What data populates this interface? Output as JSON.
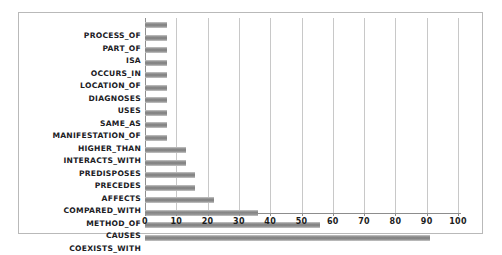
{
  "chart_data": {
    "type": "bar",
    "orientation": "horizontal",
    "title": "",
    "xlabel": "",
    "ylabel": "",
    "xlim": [
      0,
      100
    ],
    "xticks": [
      "0",
      "10",
      "20",
      "30",
      "40",
      "50",
      "60",
      "70",
      "80",
      "90",
      "100"
    ],
    "grid": true,
    "legend": false,
    "bar_color": "#808080",
    "categories": [
      "PROCESS_OF",
      "PART_OF",
      "ISA",
      "OCCURS_IN",
      "LOCATION_OF",
      "DIAGNOSES",
      "USES",
      "SAME_AS",
      "MANIFESTATION_OF",
      "HIGHER_THAN",
      "INTERACTS_WITH",
      "PREDISPOSES",
      "PRECEDES",
      "AFFECTS",
      "COMPARED_WITH",
      "METHOD_OF",
      "CAUSES",
      "COEXISTS_WITH"
    ],
    "values": [
      7,
      7,
      7,
      7,
      7,
      7,
      7,
      7,
      7,
      7,
      13,
      13,
      16,
      16,
      22,
      36,
      56,
      91
    ]
  }
}
